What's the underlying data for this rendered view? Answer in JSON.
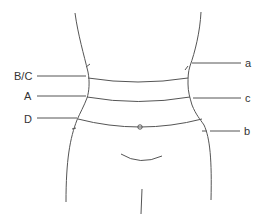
{
  "diagram": {
    "type": "waist-measurement-guide",
    "left_labels": [
      {
        "id": "bc",
        "text": "B/C"
      },
      {
        "id": "a_upper",
        "text": "A"
      },
      {
        "id": "d",
        "text": "D"
      }
    ],
    "right_labels": [
      {
        "id": "a_lower",
        "text": "a"
      },
      {
        "id": "c_lower",
        "text": "c"
      },
      {
        "id": "b_lower",
        "text": "b"
      }
    ],
    "colors": {
      "line": "#555555",
      "text": "#333333",
      "background": "#ffffff"
    }
  }
}
